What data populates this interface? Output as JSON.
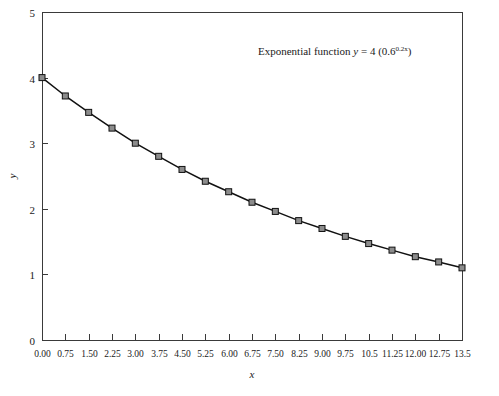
{
  "chart_data": {
    "type": "line",
    "title": "",
    "annotation": {
      "prefix": "Exponential function",
      "var": "y",
      "equals": "= 4  (0.6",
      "exponent": "0.2x",
      "suffix": ")",
      "full_text": "Exponential function y = 4 (0.6^0.2x)"
    },
    "xlabel": "x",
    "ylabel": "y",
    "xlim": [
      0,
      13.5
    ],
    "ylim": [
      0,
      5
    ],
    "grid": false,
    "legend": null,
    "xticks": [
      0,
      0.75,
      1.5,
      2.25,
      3,
      3.75,
      4.5,
      5.25,
      6,
      6.75,
      7.5,
      8.25,
      9,
      9.75,
      10.5,
      11.25,
      12,
      12.75,
      13.5
    ],
    "xticklabels": [
      "0.00",
      "0.75",
      "1.50",
      "2.25",
      "3.00",
      "3.75",
      "4.50",
      "5.25",
      "6.00",
      "6.75",
      "7.50",
      "8.25",
      "9.00",
      "9.75",
      "10.5",
      "11.25",
      "12.00",
      "12.75",
      "13.5"
    ],
    "yticks": [
      0,
      1,
      2,
      3,
      4,
      5
    ],
    "yticklabels": [
      "0",
      "1",
      "2",
      "3",
      "4",
      "5"
    ],
    "series": [
      {
        "name": "y = 4 (0.6^0.2x)",
        "marker": "square",
        "marker_fill": "#8c8c8c",
        "line_color": "#111111",
        "x": [
          0,
          0.75,
          1.5,
          2.25,
          3,
          3.75,
          4.5,
          5.25,
          6,
          6.75,
          7.5,
          8.25,
          9,
          9.75,
          10.5,
          11.25,
          12,
          12.75,
          13.5
        ],
        "values": [
          4.0,
          3.72,
          3.47,
          3.23,
          3.0,
          2.8,
          2.6,
          2.42,
          2.26,
          2.1,
          1.96,
          1.82,
          1.7,
          1.58,
          1.47,
          1.37,
          1.27,
          1.19,
          1.1
        ]
      }
    ]
  },
  "colors": {
    "frame": "#3a3a3a",
    "line": "#111111",
    "marker_fill": "#8c8c8c",
    "background": "#ffffff",
    "text": "#1a1a1a"
  }
}
